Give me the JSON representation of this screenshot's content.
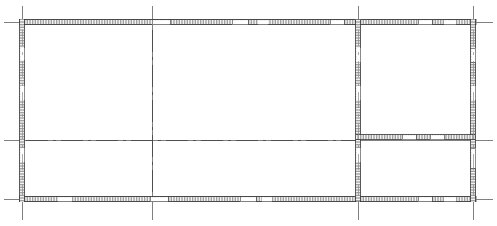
{
  "drawing": {
    "type": "architectural-floor-plan",
    "title": "",
    "canvas": {
      "width": 497,
      "height": 226
    },
    "background_color": "#ffffff",
    "line_color": "#2b2b2b",
    "grid_color": "#4a4a4a",
    "wall_fill_color": "#b9b9b9",
    "centerline_color": "#3d3d3d"
  },
  "grid": {
    "vertical_axes": [
      {
        "name": "axis-v-1",
        "x": 22,
        "y_start": 6,
        "y_end": 220
      },
      {
        "name": "axis-v-2",
        "x": 152,
        "y_start": 6,
        "y_end": 220
      },
      {
        "name": "axis-v-3",
        "x": 358,
        "y_start": 6,
        "y_end": 220
      },
      {
        "name": "axis-v-4",
        "x": 473,
        "y_start": 6,
        "y_end": 220
      }
    ],
    "horizontal_axes": [
      {
        "name": "axis-h-1",
        "y": 22,
        "x_start": 4,
        "x_end": 493
      },
      {
        "name": "axis-h-2",
        "y": 140,
        "x_start": 4,
        "x_end": 493
      },
      {
        "name": "axis-h-3",
        "y": 199,
        "x_start": 4,
        "x_end": 493
      }
    ]
  },
  "walls": {
    "thickness": 5,
    "exterior": [
      {
        "name": "wall-north",
        "orientation": "horizontal",
        "x1": 19,
        "x2": 476,
        "y": 22
      },
      {
        "name": "wall-south",
        "orientation": "horizontal",
        "x1": 19,
        "x2": 476,
        "y": 199
      },
      {
        "name": "wall-west",
        "orientation": "vertical",
        "y1": 19,
        "y2": 202,
        "x": 22
      },
      {
        "name": "wall-east",
        "orientation": "vertical",
        "y1": 19,
        "y2": 202,
        "x": 473
      }
    ],
    "interior": [
      {
        "name": "wall-partition-vertical",
        "orientation": "vertical",
        "y1": 22,
        "y2": 199,
        "x": 358
      },
      {
        "name": "wall-partition-horizontal-right",
        "orientation": "horizontal",
        "x1": 358,
        "x2": 473,
        "y": 137
      }
    ]
  },
  "openings": [
    {
      "name": "opening-north-1",
      "wall": "wall-north",
      "start": 152,
      "end": 170
    },
    {
      "name": "opening-north-2",
      "wall": "wall-north",
      "start": 232,
      "end": 248
    },
    {
      "name": "opening-north-3",
      "wall": "wall-north",
      "start": 258,
      "end": 268
    },
    {
      "name": "opening-north-4",
      "wall": "wall-north",
      "start": 330,
      "end": 344
    },
    {
      "name": "opening-north-5",
      "wall": "wall-north",
      "start": 418,
      "end": 432
    },
    {
      "name": "opening-north-6",
      "wall": "wall-north",
      "start": 444,
      "end": 456
    },
    {
      "name": "opening-south-1",
      "wall": "wall-south",
      "start": 58,
      "end": 72
    },
    {
      "name": "opening-south-2",
      "wall": "wall-south",
      "start": 150,
      "end": 168
    },
    {
      "name": "opening-south-3",
      "wall": "wall-south",
      "start": 240,
      "end": 256
    },
    {
      "name": "opening-south-4",
      "wall": "wall-south",
      "start": 262,
      "end": 272
    },
    {
      "name": "opening-south-5",
      "wall": "wall-south",
      "start": 418,
      "end": 432
    },
    {
      "name": "opening-south-6",
      "wall": "wall-south",
      "start": 444,
      "end": 456
    },
    {
      "name": "opening-west-1",
      "wall": "wall-west",
      "start": 48,
      "end": 60
    },
    {
      "name": "opening-west-2",
      "wall": "wall-west",
      "start": 86,
      "end": 100
    },
    {
      "name": "opening-west-3",
      "wall": "wall-west",
      "start": 148,
      "end": 162
    },
    {
      "name": "opening-east-1",
      "wall": "wall-east",
      "start": 48,
      "end": 62
    },
    {
      "name": "opening-east-2",
      "wall": "wall-east",
      "start": 86,
      "end": 100
    },
    {
      "name": "opening-east-3",
      "wall": "wall-east",
      "start": 148,
      "end": 168
    },
    {
      "name": "opening-partition-1",
      "wall": "wall-partition-vertical",
      "start": 48,
      "end": 62
    },
    {
      "name": "opening-partition-2",
      "wall": "wall-partition-vertical",
      "start": 86,
      "end": 100
    },
    {
      "name": "opening-partition-3",
      "wall": "wall-partition-vertical",
      "start": 148,
      "end": 162
    },
    {
      "name": "opening-interior-h-1",
      "wall": "wall-partition-horizontal-right",
      "start": 402,
      "end": 416
    },
    {
      "name": "opening-interior-h-2",
      "wall": "wall-partition-horizontal-right",
      "start": 430,
      "end": 444
    }
  ],
  "centerlines": [
    {
      "name": "centerline-vertical-middle",
      "orientation": "vertical",
      "x": 152,
      "y1": 30,
      "y2": 196
    },
    {
      "name": "centerline-horizontal-middle",
      "orientation": "horizontal",
      "y": 140,
      "x1": 26,
      "x2": 356
    },
    {
      "name": "centerline-vertical-east",
      "orientation": "vertical",
      "x": 473,
      "y1": 30,
      "y2": 196
    },
    {
      "name": "centerline-vertical-west",
      "orientation": "vertical",
      "x": 22,
      "y1": 30,
      "y2": 196
    },
    {
      "name": "centerline-vertical-partition",
      "orientation": "vertical",
      "x": 358,
      "y1": 30,
      "y2": 196
    }
  ],
  "rooms": [
    {
      "name": "room-left",
      "label": "",
      "x": 22,
      "y": 22,
      "width": 336,
      "height": 177
    },
    {
      "name": "room-right-upper",
      "label": "",
      "x": 358,
      "y": 22,
      "width": 115,
      "height": 115
    },
    {
      "name": "room-right-lower",
      "label": "",
      "x": 358,
      "y": 137,
      "width": 115,
      "height": 62
    }
  ]
}
